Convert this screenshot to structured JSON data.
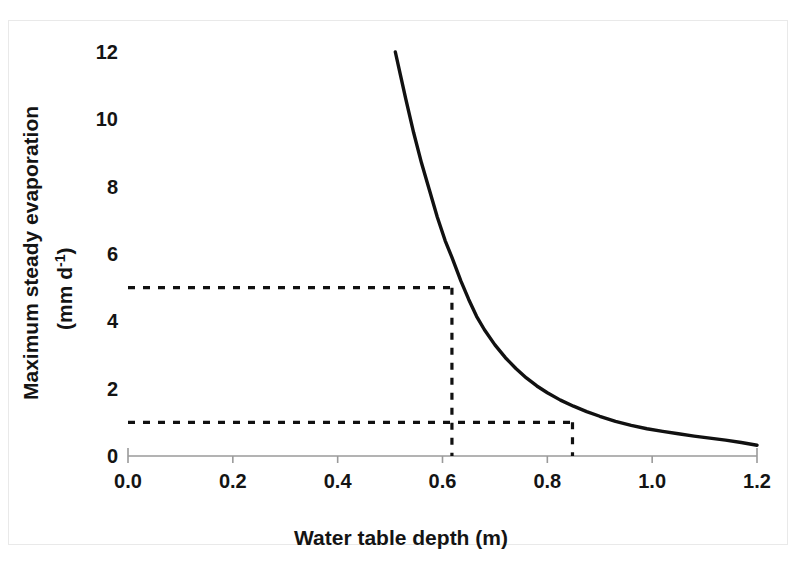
{
  "chart_data": {
    "type": "line",
    "title": "",
    "xlabel": "Water table depth (m)",
    "ylabel_line1": "Maximum steady evaporation",
    "ylabel_line2": "(mm d",
    "ylabel_sup": "-1",
    "ylabel_line2_end": ")",
    "xlim": [
      0.0,
      1.2
    ],
    "ylim": [
      0,
      12
    ],
    "grid": false,
    "legend": "none",
    "xticks": [
      "0.0",
      "0.2",
      "0.4",
      "0.6",
      "0.8",
      "1.0",
      "1.2"
    ],
    "xtick_values": [
      0.0,
      0.2,
      0.4,
      0.6,
      0.8,
      1.0,
      1.2
    ],
    "yticks": [
      "0",
      "2",
      "4",
      "6",
      "8",
      "10",
      "12"
    ],
    "ytick_values": [
      0,
      2,
      4,
      6,
      8,
      10,
      12
    ],
    "series": [
      {
        "name": "Maximum steady evaporation",
        "color": "#111111",
        "style": "solid",
        "x": [
          0.51,
          0.52,
          0.53,
          0.545,
          0.56,
          0.575,
          0.59,
          0.605,
          0.618,
          0.635,
          0.65,
          0.665,
          0.68,
          0.7,
          0.72,
          0.74,
          0.76,
          0.78,
          0.8,
          0.825,
          0.85,
          0.875,
          0.9,
          0.93,
          0.96,
          0.99,
          1.02,
          1.05,
          1.08,
          1.11,
          1.14,
          1.17,
          1.2
        ],
        "y": [
          12.0,
          11.3,
          10.6,
          9.6,
          8.7,
          7.9,
          7.1,
          6.4,
          5.9,
          5.2,
          4.65,
          4.15,
          3.75,
          3.3,
          2.92,
          2.6,
          2.32,
          2.08,
          1.88,
          1.66,
          1.48,
          1.32,
          1.18,
          1.03,
          0.91,
          0.81,
          0.73,
          0.66,
          0.59,
          0.53,
          0.47,
          0.4,
          0.32
        ]
      }
    ],
    "annotations": [
      {
        "name": "guide-5mm",
        "style": "dashed",
        "color": "#111111",
        "horizontal_y": 5,
        "horizontal_x_from": 0.0,
        "horizontal_x_to": 0.618,
        "vertical_x": 0.618,
        "vertical_y_from": 5,
        "vertical_y_to": 0
      },
      {
        "name": "guide-1mm",
        "style": "dashed",
        "color": "#111111",
        "horizontal_y": 1,
        "horizontal_x_from": 0.0,
        "horizontal_x_to": 0.848,
        "vertical_x": 0.848,
        "vertical_y_from": 1,
        "vertical_y_to": 0
      }
    ]
  },
  "axes": {
    "x_axis_color": "#9a9a9a",
    "tick_color": "#111111",
    "background": "#ffffff"
  }
}
